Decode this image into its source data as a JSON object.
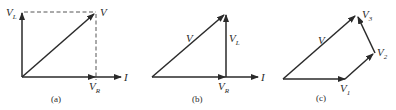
{
  "figure": {
    "panels": [
      {
        "id": "a",
        "caption": "(a)",
        "labels": {
          "vl": {
            "main": "V",
            "sub": "L"
          },
          "v": {
            "main": "V"
          },
          "vr": {
            "main": "V",
            "sub": "R"
          },
          "i": {
            "main": "I"
          }
        }
      },
      {
        "id": "b",
        "caption": "(b)",
        "labels": {
          "v": {
            "main": "V"
          },
          "vl": {
            "main": "V",
            "sub": "L"
          },
          "vr": {
            "main": "V",
            "sub": "R"
          },
          "i": {
            "main": "I"
          }
        }
      },
      {
        "id": "c",
        "caption": "(c)",
        "labels": {
          "v": {
            "main": "V"
          },
          "v1": {
            "main": "V",
            "sub": "1"
          },
          "v2": {
            "main": "V",
            "sub": "2"
          },
          "v3": {
            "main": "V",
            "sub": "3"
          }
        }
      }
    ],
    "colors": {
      "ink": "#2a2a2a",
      "dashed": "#555555",
      "background": "#ffffff"
    }
  }
}
